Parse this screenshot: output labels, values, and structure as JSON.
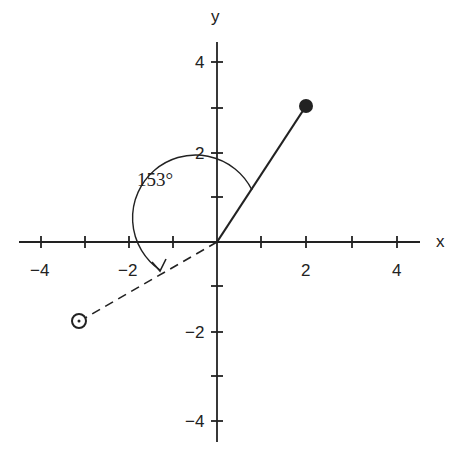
{
  "diagram": {
    "axes": {
      "x_label": "x",
      "y_label": "y",
      "x_ticks": [
        "−4",
        "−2",
        "2",
        "4"
      ],
      "y_ticks": [
        "4",
        "2",
        "−2",
        "−4"
      ],
      "range": [
        -4.5,
        4.5
      ]
    },
    "angle_label": "153°",
    "vectors": [
      {
        "name": "solid",
        "from": [
          0,
          0
        ],
        "to": [
          2,
          3
        ],
        "endpoint": "filled-dot"
      },
      {
        "name": "dashed",
        "from": [
          0,
          0
        ],
        "to": [
          -3.1,
          -1.8
        ],
        "endpoint": "open-circle"
      }
    ],
    "arc": {
      "radius": 1.4,
      "start_deg": 56,
      "end_deg": 209,
      "arrow": true
    },
    "colors": {
      "ink": "#222222",
      "background": "#ffffff"
    }
  }
}
